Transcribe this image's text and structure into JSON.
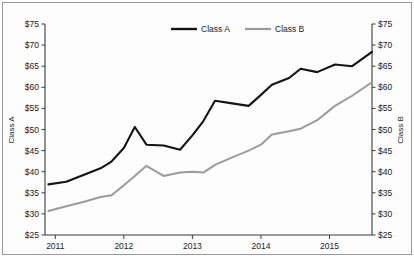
{
  "chart_data": {
    "type": "line",
    "title": "",
    "xlabel": "",
    "ylabel": "Class A",
    "y2label": "Class B",
    "grid": false,
    "legend_position": "top-center",
    "ylim": [
      25,
      75
    ],
    "y2lim": [
      25,
      75
    ],
    "ytick_labels": [
      "$75",
      "$70",
      "$65",
      "$60",
      "$55",
      "$50",
      "$45",
      "$40",
      "$35",
      "$30",
      "$25"
    ],
    "ytick_values": [
      75,
      70,
      65,
      60,
      55,
      50,
      45,
      40,
      35,
      30,
      25
    ],
    "y2tick_labels": [
      "$75",
      "$70",
      "$65",
      "$60",
      "$55",
      "$50",
      "$45",
      "$40",
      "$35",
      "$30",
      "$25"
    ],
    "y2tick_values": [
      75,
      70,
      65,
      60,
      55,
      50,
      45,
      40,
      35,
      30,
      25
    ],
    "xtick_labels": [
      "2011",
      "2012",
      "2013",
      "2014",
      "2015"
    ],
    "xtick_values": [
      2011,
      2012,
      2013,
      2014,
      2015
    ],
    "xlim": [
      2010.85,
      2015.62
    ],
    "series": [
      {
        "name": "Class A",
        "color": "#141414",
        "x": [
          2010.9,
          2011.16,
          2011.41,
          2011.66,
          2011.82,
          2012.0,
          2012.16,
          2012.33,
          2012.58,
          2012.82,
          2013.0,
          2013.16,
          2013.33,
          2013.58,
          2013.82,
          2014.0,
          2014.16,
          2014.41,
          2014.58,
          2014.82,
          2015.08,
          2015.33,
          2015.62
        ],
        "values": [
          37.0,
          37.6,
          39.2,
          40.8,
          42.4,
          45.6,
          50.6,
          46.4,
          46.2,
          45.2,
          48.6,
          52.0,
          56.8,
          56.2,
          55.6,
          58.2,
          60.6,
          62.2,
          64.4,
          63.6,
          65.4,
          65.0,
          68.4
        ]
      },
      {
        "name": "Class B",
        "color": "#9b9b9b",
        "x": [
          2010.9,
          2011.16,
          2011.41,
          2011.66,
          2011.82,
          2012.0,
          2012.16,
          2012.33,
          2012.58,
          2012.82,
          2013.0,
          2013.16,
          2013.33,
          2013.58,
          2013.82,
          2014.0,
          2014.16,
          2014.41,
          2014.58,
          2014.82,
          2015.08,
          2015.33,
          2015.62
        ],
        "values": [
          30.7,
          31.8,
          32.8,
          34.0,
          34.4,
          36.8,
          39.0,
          41.4,
          39.0,
          39.8,
          40.0,
          39.8,
          41.6,
          43.4,
          45.0,
          46.4,
          48.8,
          49.6,
          50.2,
          52.2,
          55.6,
          58.0,
          61.2
        ]
      }
    ]
  },
  "legend": {
    "items": [
      {
        "label": "Class A"
      },
      {
        "label": "Class B"
      }
    ]
  },
  "axes": {
    "left_title": "Class A",
    "right_title": "Class B"
  }
}
